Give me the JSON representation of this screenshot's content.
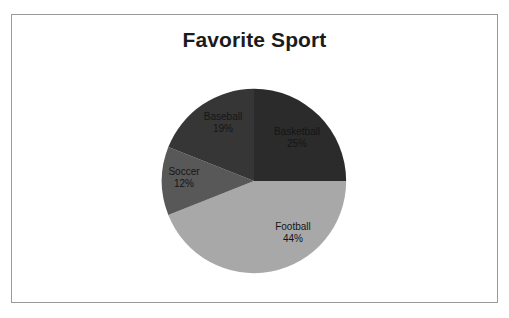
{
  "chart_data": {
    "type": "pie",
    "title": "Favorite Sport",
    "categories": [
      "Basketball",
      "Football",
      "Soccer",
      "Baseball"
    ],
    "values": [
      25,
      44,
      12,
      19
    ],
    "value_unit": "%",
    "labels": [
      {
        "name": "Basketball",
        "value": 25,
        "value_text": "25%",
        "color": "#2b2b2b",
        "label_color": "#151515"
      },
      {
        "name": "Football",
        "value": 44,
        "value_text": "44%",
        "color": "#a8a8a8",
        "label_color": "#151515"
      },
      {
        "name": "Soccer",
        "value": 12,
        "value_text": "12%",
        "color": "#585858",
        "label_color": "#151515"
      },
      {
        "name": "Baseball",
        "value": 19,
        "value_text": "19%",
        "color": "#363636",
        "label_color": "#151515"
      }
    ],
    "start_angle_deg": 0,
    "direction": "clockwise",
    "legend": "none",
    "grid": false,
    "data_labels": "name-and-percent-inside"
  },
  "frame": {
    "border_color": "#9a9a9a",
    "background": "#ffffff"
  }
}
